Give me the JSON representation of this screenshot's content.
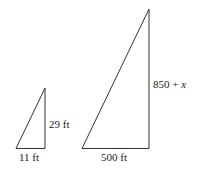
{
  "diagram": {
    "small_triangle": {
      "height_label": "29 ft",
      "base_label": "11 ft"
    },
    "large_triangle": {
      "height_label_prefix": "850 + ",
      "height_label_var": "x",
      "base_label": "500 ft"
    },
    "stroke_color": "#333333"
  }
}
